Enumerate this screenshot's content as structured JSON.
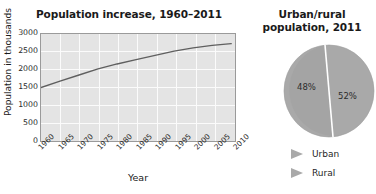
{
  "chart_data": [
    {
      "type": "line",
      "title": "Population increase, 1960–2011",
      "xlabel": "Year",
      "ylabel": "Population in thousands",
      "x": [
        1960,
        1965,
        1970,
        1975,
        1980,
        1985,
        1990,
        1995,
        2000,
        2005,
        2010
      ],
      "values": [
        1500,
        1680,
        1850,
        2020,
        2160,
        2280,
        2400,
        2520,
        2610,
        2680,
        2730
      ],
      "xticklabels": [
        "1960",
        "1965",
        "1970",
        "1975",
        "1980",
        "1985",
        "1990",
        "1995",
        "2000",
        "2005",
        "2010"
      ],
      "yticklabels": [
        "0",
        "500",
        "1000",
        "1500",
        "2000",
        "2500",
        "3000"
      ],
      "ylim": [
        0,
        3000
      ],
      "xlim": [
        1960,
        2011
      ],
      "grid": true,
      "legend": "none",
      "line_color": "#5f5f5f",
      "plot_bg": "#e4e4e4",
      "gridline_color": "#fbfbfb"
    },
    {
      "type": "pie",
      "title_line1": "Urban/rural",
      "title_line2": "population, 2011",
      "labels": [
        "Urban",
        "Rural"
      ],
      "values": [
        52,
        48
      ],
      "slice_labels": [
        "52%",
        "48%"
      ],
      "legend_position": "bottom",
      "slice_colors": [
        "#a8a8a8",
        "#a0a0a0"
      ],
      "divider_color": "#ffffff",
      "marker_icon": "triangle-right-icon",
      "marker_color": "#a8a8a8"
    }
  ],
  "line": {
    "title": "Population increase, 1960–2011",
    "xlabel": "Year",
    "ylabel": "Population in thousands",
    "yticks": [
      "3000",
      "2500",
      "2000",
      "1500",
      "1000",
      "500",
      "0"
    ],
    "xticks": [
      "1960",
      "1965",
      "1970",
      "1975",
      "1980",
      "1985",
      "1990",
      "1995",
      "2000",
      "2005",
      "2010"
    ]
  },
  "pie": {
    "title_line1": "Urban/rural",
    "title_line2": "population, 2011",
    "label_left": "48%",
    "label_right": "52%",
    "legend": [
      {
        "label": "Urban"
      },
      {
        "label": "Rural"
      }
    ]
  }
}
